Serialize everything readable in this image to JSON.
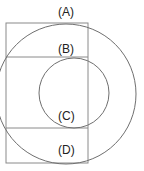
{
  "figure": {
    "title": "",
    "background_color": "#ffffff",
    "stroke_color": "#808080",
    "label_color": "#222222",
    "stroke_width": 1,
    "labels": [
      {
        "id": "A",
        "text": "(A)",
        "x": 58,
        "y": 6,
        "target": "outer-circle"
      },
      {
        "id": "B",
        "text": "(B)",
        "x": 58,
        "y": 43,
        "target": "inner-circle-top"
      },
      {
        "id": "C",
        "text": "(C)",
        "x": 58,
        "y": 110,
        "target": "inner-circle-bottom"
      },
      {
        "id": "D",
        "text": "(D)",
        "x": 58,
        "y": 144,
        "target": "outer-circle-bottom"
      }
    ],
    "shapes": {
      "outer_circle": {
        "cx": 66,
        "cy": 94,
        "r": 70
      },
      "inner_circle": {
        "cx": 74,
        "cy": 93,
        "r": 35
      },
      "rectangle": {
        "x": 6,
        "y": 23,
        "width": 82,
        "height": 140
      },
      "leader_lines": [
        {
          "id": "leader-b",
          "x1": 6,
          "y1": 57,
          "x2": 88,
          "y2": 57
        },
        {
          "id": "leader-c",
          "x1": 6,
          "y1": 128,
          "x2": 88,
          "y2": 128
        }
      ]
    }
  }
}
